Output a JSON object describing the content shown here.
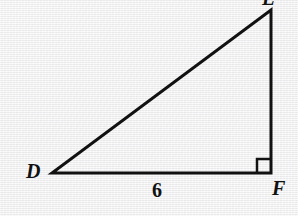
{
  "figure": {
    "kind": "right-triangle-diagram",
    "background_color": "#f3f3f3",
    "stroke_color": "#111111",
    "stroke_width": 3,
    "vertices": [
      {
        "id": "apex",
        "label": "E",
        "x": 271,
        "y": 10,
        "clipped_by_top_edge": true
      },
      {
        "id": "left",
        "label": "D",
        "x": 52,
        "y": 173,
        "clipped_by_top_edge": false
      },
      {
        "id": "right",
        "label": "F",
        "x": 271,
        "y": 173,
        "clipped_by_top_edge": false
      }
    ],
    "sides": [
      {
        "id": "base",
        "from": "left",
        "to": "right",
        "label": "6"
      },
      {
        "id": "vertical",
        "from": "right",
        "to": "apex",
        "label": ""
      },
      {
        "id": "hypotenuse",
        "from": "left",
        "to": "apex",
        "label": ""
      }
    ],
    "right_angle": {
      "at_vertex": "right",
      "marker": "square",
      "size": 14
    },
    "paths": {
      "triangle": "M 52 173 L 271 173 L 271 10 Z",
      "right_angle_marker": "M 257 173 L 257 159 L 271 159"
    },
    "labels": {
      "apex": "E",
      "left": "D",
      "right": "F",
      "base": "6"
    }
  }
}
